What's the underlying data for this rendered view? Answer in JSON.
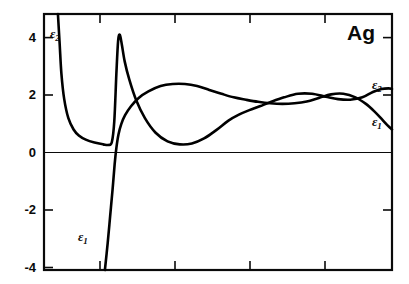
{
  "figure": {
    "sample_label": "Ag",
    "background_color": "#ffffff",
    "line_color": "#000000"
  },
  "axes": {
    "y_tick_labels": [
      "4",
      "2",
      "0",
      "-2",
      "-4"
    ],
    "y_tick_values": [
      4,
      2,
      0,
      -2,
      -4
    ],
    "x_tick_count": 5,
    "zero_line_visible": true
  },
  "annotations": {
    "eps2_inner_base": "ε",
    "eps2_inner_sub": "2",
    "eps1_inner_base": "ε",
    "eps1_inner_sub": "1",
    "eps2_right_base": "ε",
    "eps2_right_sub": "2",
    "eps1_right_base": "ε",
    "eps1_right_sub": "1"
  },
  "chart_data": {
    "type": "line",
    "title": "Ag",
    "xlabel": "",
    "ylabel": "",
    "xlim": [
      0,
      10
    ],
    "ylim": [
      -4,
      4.6
    ],
    "grid": false,
    "legend_position": "inline-annotations",
    "y_ticks": [
      4,
      2,
      0,
      -2,
      -4
    ],
    "x_ticks": [
      1.8,
      3.5,
      5.3,
      7.0,
      8.8
    ],
    "series": [
      {
        "name": "ε2",
        "label": "ε₂",
        "color": "#000000",
        "x": [
          0.4,
          0.45,
          0.5,
          0.58,
          0.7,
          0.85,
          1.0,
          1.2,
          1.45,
          1.7,
          1.85,
          1.95,
          2.02,
          2.08,
          2.13,
          2.18,
          2.24,
          2.32,
          2.45,
          2.65,
          2.9,
          3.2,
          3.55,
          3.9,
          4.25,
          4.6,
          4.95,
          5.3,
          5.6,
          5.9,
          6.2,
          6.55,
          6.9,
          7.3,
          7.7,
          8.1,
          8.45,
          8.8,
          9.15,
          9.45,
          9.7,
          9.9,
          10.0
        ],
        "y": [
          4.6,
          3.6,
          2.6,
          1.75,
          1.1,
          0.72,
          0.52,
          0.38,
          0.28,
          0.22,
          0.2,
          0.3,
          1.0,
          2.6,
          3.7,
          3.9,
          3.55,
          3.0,
          2.4,
          1.7,
          1.1,
          0.62,
          0.32,
          0.22,
          0.25,
          0.42,
          0.7,
          1.02,
          1.22,
          1.37,
          1.5,
          1.66,
          1.8,
          1.92,
          1.92,
          1.82,
          1.74,
          1.72,
          1.8,
          1.98,
          2.08,
          2.1,
          2.08
        ]
      },
      {
        "name": "ε1",
        "label": "ε₁",
        "color": "#000000",
        "x": [
          1.75,
          1.83,
          1.9,
          1.97,
          2.03,
          2.08,
          2.14,
          2.22,
          2.33,
          2.5,
          2.72,
          3.0,
          3.35,
          3.7,
          4.05,
          4.4,
          4.75,
          5.1,
          5.45,
          5.8,
          6.15,
          6.5,
          6.85,
          7.2,
          7.55,
          7.9,
          8.25,
          8.6,
          8.95,
          9.25,
          9.5,
          9.72,
          9.88,
          10.0
        ],
        "y": [
          -4.0,
          -3.1,
          -2.2,
          -1.3,
          -0.45,
          0.1,
          0.55,
          0.9,
          1.2,
          1.5,
          1.78,
          2.0,
          2.18,
          2.25,
          2.25,
          2.18,
          2.05,
          1.92,
          1.8,
          1.72,
          1.65,
          1.6,
          1.58,
          1.6,
          1.66,
          1.78,
          1.9,
          1.92,
          1.8,
          1.58,
          1.32,
          1.05,
          0.85,
          0.72
        ]
      }
    ]
  }
}
